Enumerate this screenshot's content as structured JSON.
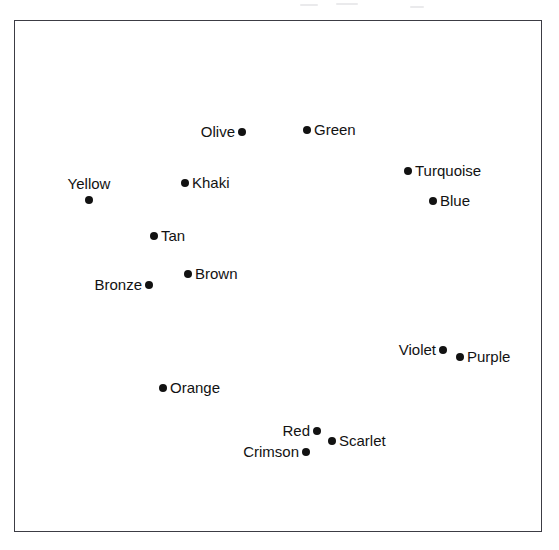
{
  "figure": {
    "width": 559,
    "height": 550,
    "background_color": "#ffffff",
    "frame": {
      "x": 14,
      "y": 20,
      "width": 528,
      "height": 512,
      "border_color": "#3c3c44",
      "fill_color": "#ffffff"
    },
    "marker_color": "#121212",
    "label_color": "#121212"
  },
  "chart_data": {
    "type": "scatter",
    "title": "",
    "xlabel": "",
    "ylabel": "",
    "grid": false,
    "legend": null,
    "axis_ticks": [],
    "xlim": [
      14,
      542
    ],
    "ylim": [
      20,
      532
    ],
    "note": "Unlabeled axes; a bordered plotting box containing 14 labeled color-term points.",
    "points": [
      {
        "label": "Olive",
        "x": 241,
        "y": 131,
        "label_side": "left"
      },
      {
        "label": "Green",
        "x": 306,
        "y": 129,
        "label_side": "right"
      },
      {
        "label": "Turquoise",
        "x": 407,
        "y": 170,
        "label_side": "right"
      },
      {
        "label": "Yellow",
        "x": 88,
        "y": 199,
        "label_side": "above"
      },
      {
        "label": "Khaki",
        "x": 184,
        "y": 182,
        "label_side": "right"
      },
      {
        "label": "Blue",
        "x": 432,
        "y": 200,
        "label_side": "right"
      },
      {
        "label": "Tan",
        "x": 153,
        "y": 235,
        "label_side": "right"
      },
      {
        "label": "Brown",
        "x": 187,
        "y": 273,
        "label_side": "right"
      },
      {
        "label": "Bronze",
        "x": 148,
        "y": 284,
        "label_side": "left"
      },
      {
        "label": "Violet",
        "x": 442,
        "y": 349,
        "label_side": "left"
      },
      {
        "label": "Purple",
        "x": 459,
        "y": 356,
        "label_side": "right"
      },
      {
        "label": "Orange",
        "x": 162,
        "y": 387,
        "label_side": "right"
      },
      {
        "label": "Red",
        "x": 316,
        "y": 430,
        "label_side": "left"
      },
      {
        "label": "Scarlet",
        "x": 331,
        "y": 440,
        "label_side": "right"
      },
      {
        "label": "Crimson",
        "x": 305,
        "y": 451,
        "label_side": "left"
      }
    ]
  }
}
